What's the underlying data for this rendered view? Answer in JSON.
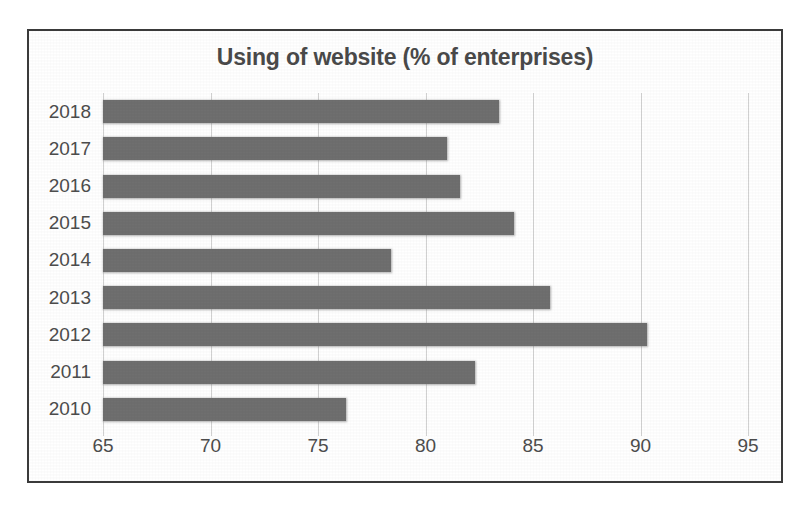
{
  "chart_data": {
    "type": "bar",
    "orientation": "horizontal",
    "title": "Using of website (% of enterprises)",
    "xlabel": "",
    "ylabel": "",
    "categories": [
      "2018",
      "2017",
      "2016",
      "2015",
      "2014",
      "2013",
      "2012",
      "2011",
      "2010"
    ],
    "values": [
      83.4,
      81.0,
      81.6,
      84.1,
      78.4,
      85.8,
      90.3,
      82.3,
      76.3
    ],
    "xlim": [
      65,
      95
    ],
    "xticks": [
      65,
      70,
      75,
      80,
      85,
      90,
      95
    ],
    "xtick_labels": [
      "65",
      "70",
      "75",
      "80",
      "85",
      "90",
      "95"
    ],
    "grid": "vertical-only",
    "legend": "none",
    "series": [
      {
        "name": "Using of website (% of enterprises)",
        "values": [
          83.4,
          81.0,
          81.6,
          84.1,
          78.4,
          85.8,
          90.3,
          82.3,
          76.3
        ]
      }
    ],
    "colors": {
      "bar": "#6f6f6f",
      "gridline": "#d2d2d2",
      "text": "#4d4d4d",
      "title": "#4a4a4a",
      "frame": "#3a3a3a",
      "background": "#ffffff"
    }
  }
}
